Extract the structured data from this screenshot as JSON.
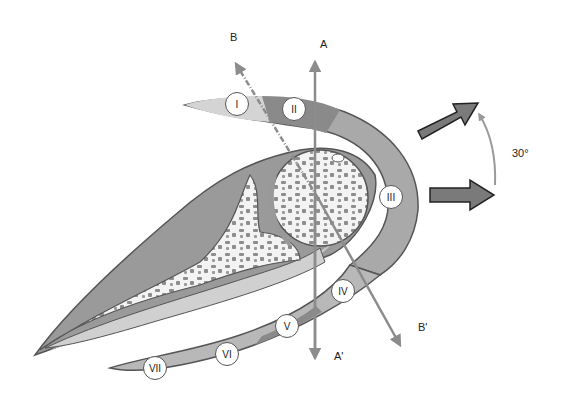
{
  "figure": {
    "axes": {
      "a_top": "A",
      "a_bottom": "A'",
      "b_top": "B",
      "b_bottom": "B'"
    },
    "rotation_label": "30°",
    "zones": [
      {
        "id": "I",
        "label": "I",
        "x": 237,
        "y": 104
      },
      {
        "id": "II",
        "label": "II",
        "x": 294,
        "y": 109
      },
      {
        "id": "III",
        "label": "III",
        "x": 391,
        "y": 197
      },
      {
        "id": "IV",
        "label": "IV",
        "x": 343,
        "y": 291
      },
      {
        "id": "V",
        "label": "V",
        "x": 287,
        "y": 326
      },
      {
        "id": "VI",
        "label": "VI",
        "x": 227,
        "y": 354
      },
      {
        "id": "VII",
        "label": "VII",
        "x": 155,
        "y": 368
      }
    ],
    "colors": {
      "outline": "#555555",
      "tissue_dark": "#8a8a8a",
      "tissue_mid": "#a9a9a9",
      "tissue_light": "#c6c6c6",
      "tissue_lighter": "#d4d4d4",
      "bone_fill": "#f3f3f3",
      "trabecula": "#8d8d8d",
      "axis_arrow": "#8c8c8c",
      "block_arrow": "#7a7a7a"
    }
  }
}
